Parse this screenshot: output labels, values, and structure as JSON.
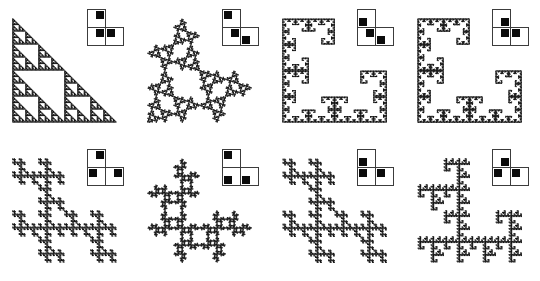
{
  "figure": {
    "background": "#ffffff",
    "ink_color": "#131313",
    "inset_border_color": "#3c3c3c",
    "marker_color": "#0b0b0b",
    "rows": 2,
    "cols": 4,
    "render": {
      "depth": 7,
      "dot_size": 1.15,
      "draw_size": 104,
      "pad_x": 7,
      "pad_y": 10
    },
    "panels": [
      {
        "id": "sierpinski-triangle",
        "generator_cells": [
          {
            "pos": "tl",
            "marker": "tr"
          },
          {
            "pos": "bl",
            "marker": "tr"
          },
          {
            "pos": "br",
            "marker": "tl"
          }
        ],
        "ifs": [
          {
            "cell": "tl",
            "orient": "id"
          },
          {
            "cell": "bl",
            "orient": "id"
          },
          {
            "cell": "br",
            "orient": "id"
          }
        ]
      },
      {
        "id": "rotated-triangle-clusters",
        "generator_cells": [
          {
            "pos": "tl",
            "marker": "tl"
          },
          {
            "pos": "bl",
            "marker": "tr"
          },
          {
            "pos": "br",
            "marker": "bl"
          }
        ],
        "ifs": [
          {
            "cell": "tl",
            "orient": "r90"
          },
          {
            "cell": "bl",
            "orient": "id"
          },
          {
            "cell": "br",
            "orient": "r270"
          }
        ]
      },
      {
        "id": "rosette-clusters",
        "generator_cells": [
          {
            "pos": "tl",
            "marker": "bl"
          },
          {
            "pos": "bl",
            "marker": "tr"
          },
          {
            "pos": "br",
            "marker": "bl"
          }
        ],
        "ifs": [
          {
            "cell": "tl",
            "orient": "fv"
          },
          {
            "cell": "bl",
            "orient": "id"
          },
          {
            "cell": "br",
            "orient": "fh"
          }
        ]
      },
      {
        "id": "l-shaped-boundary-curve",
        "generator_cells": [
          {
            "pos": "tl",
            "marker": "br"
          },
          {
            "pos": "bl",
            "marker": "tr"
          },
          {
            "pos": "br",
            "marker": "tl"
          }
        ],
        "ifs": [
          {
            "cell": "tl",
            "orient": "r270"
          },
          {
            "cell": "bl",
            "orient": "id"
          },
          {
            "cell": "br",
            "orient": "r90"
          }
        ]
      },
      {
        "id": "diagonal-stripes",
        "generator_cells": [
          {
            "pos": "tl",
            "marker": "tr"
          },
          {
            "pos": "bl",
            "marker": "tl"
          },
          {
            "pos": "br",
            "marker": "tr"
          }
        ],
        "ifs": [
          {
            "cell": "tl",
            "orient": "tp"
          },
          {
            "cell": "bl",
            "orient": "tp"
          },
          {
            "cell": "br",
            "orient": "tp"
          }
        ]
      },
      {
        "id": "cross-chain-clusters",
        "generator_cells": [
          {
            "pos": "tl",
            "marker": "tl"
          },
          {
            "pos": "bl",
            "marker": "bl"
          },
          {
            "pos": "br",
            "marker": "bl"
          }
        ],
        "ifs": [
          {
            "cell": "tl",
            "orient": "r90"
          },
          {
            "cell": "bl",
            "orient": "r180"
          },
          {
            "cell": "br",
            "orient": "r270"
          }
        ]
      },
      {
        "id": "double-arrow-diagonal",
        "generator_cells": [
          {
            "pos": "tl",
            "marker": "bl"
          },
          {
            "pos": "bl",
            "marker": "tl"
          },
          {
            "pos": "br",
            "marker": "tl"
          }
        ],
        "ifs": [
          {
            "cell": "tl",
            "orient": "r180"
          },
          {
            "cell": "bl",
            "orient": "r180"
          },
          {
            "cell": "br",
            "orient": "r180"
          }
        ]
      },
      {
        "id": "spiral-curls",
        "generator_cells": [
          {
            "pos": "tl",
            "marker": "br"
          },
          {
            "pos": "bl",
            "marker": "tl"
          },
          {
            "pos": "br",
            "marker": "tl"
          }
        ],
        "ifs": [
          {
            "cell": "tl",
            "orient": "r90"
          },
          {
            "cell": "bl",
            "orient": "r90"
          },
          {
            "cell": "br",
            "orient": "r90"
          }
        ]
      }
    ]
  }
}
